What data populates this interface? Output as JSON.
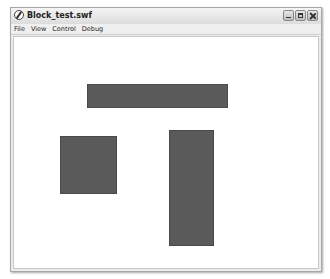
{
  "window": {
    "title": "Block_test.swf",
    "controls": [
      "minimize",
      "maximize",
      "close"
    ]
  },
  "menubar": {
    "items": [
      {
        "label": "File"
      },
      {
        "label": "View"
      },
      {
        "label": "Control"
      },
      {
        "label": "Debug"
      }
    ]
  },
  "stage": {
    "background": "#ffffff",
    "blocks": [
      {
        "name": "horizontal-bar",
        "x": 87,
        "y": 84,
        "width": 141,
        "height": 24,
        "color": "#5a5a5a"
      },
      {
        "name": "square",
        "x": 60,
        "y": 136,
        "width": 57,
        "height": 58,
        "color": "#5a5a5a"
      },
      {
        "name": "vertical-bar",
        "x": 169,
        "y": 130,
        "width": 45,
        "height": 116,
        "color": "#5a5a5a"
      }
    ]
  }
}
